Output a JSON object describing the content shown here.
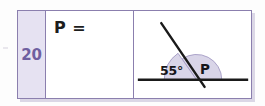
{
  "worksheet": {
    "problem_number": "20",
    "answer_prompt": "P =",
    "answer_value": "",
    "degree_symbol": "°"
  },
  "figure": {
    "name": "linear-pair-angle-diagram",
    "baseline_label": "",
    "angles": [
      {
        "name": "known-angle",
        "label": "55°",
        "value": 55
      },
      {
        "name": "unknown-angle",
        "label": "P",
        "value": 125
      }
    ],
    "colors": {
      "sector_fill": "#d9d5e8",
      "sector_stroke": "#a49cc4",
      "line": "#1a1a1a",
      "table_border": "#8b7fae",
      "number_cell_bg": "#e6e2f2",
      "number_text": "#6f5fa0"
    }
  }
}
